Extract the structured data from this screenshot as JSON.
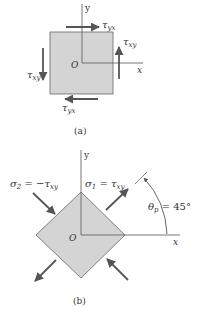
{
  "figure_a": {
    "caption": "(a)",
    "axes": {
      "x": "x",
      "y": "y",
      "origin": "O"
    },
    "element_fill": "#d4d4d4",
    "stresses": {
      "top": {
        "symbol": "τ",
        "sub": "yx",
        "direction": "right"
      },
      "bottom": {
        "symbol": "τ",
        "sub": "yx",
        "direction": "left"
      },
      "right": {
        "symbol": "τ",
        "sub": "xy",
        "direction": "up"
      },
      "left": {
        "symbol": "τ",
        "sub": "xy",
        "direction": "down"
      }
    }
  },
  "figure_b": {
    "caption": "(b)",
    "axes": {
      "x": "x",
      "y": "y",
      "origin": "O"
    },
    "element_fill": "#d4d4d4",
    "sigma2": {
      "symbol": "σ",
      "sub": "2",
      "eq": " = −τ",
      "eq_sub": "xy",
      "type": "compressive"
    },
    "sigma1": {
      "symbol": "σ",
      "sub": "1",
      "eq": " = τ",
      "eq_sub": "xy",
      "type": "tensile"
    },
    "angle": {
      "symbol": "θ",
      "sub": "p",
      "value": " = 45°"
    }
  },
  "colors": {
    "line": "#555555",
    "arrow": "#555555",
    "fill": "#d4d4d4",
    "text": "#333333"
  }
}
